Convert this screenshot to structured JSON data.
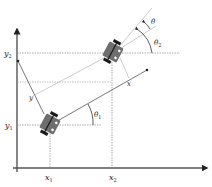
{
  "diagram": {
    "type": "robot-kinematics-coordinate-frames",
    "colors": {
      "axis": "#555555",
      "dashed": "#888888",
      "robot_body": "#6e6e6e",
      "wheel": "#1a1a1a",
      "thin_line": "#9a9a9a"
    },
    "labels": {
      "x1": "x",
      "x1_sub": "1",
      "x2": "x",
      "x2_sub": "2",
      "y1": "y",
      "y1_sub": "1",
      "y2": "y",
      "y2_sub": "2",
      "robot_x_axis": "x",
      "robot_y_axis": "y",
      "theta1": "θ",
      "theta1_sub": "1",
      "theta2": "θ",
      "theta2_sub": "2",
      "theta": "θ"
    },
    "robots": [
      {
        "name": "robot-1",
        "cx": 50,
        "cy": 124,
        "angle_deg": 28
      },
      {
        "name": "robot-2",
        "cx": 113,
        "cy": 52,
        "angle_deg": 28
      }
    ]
  }
}
